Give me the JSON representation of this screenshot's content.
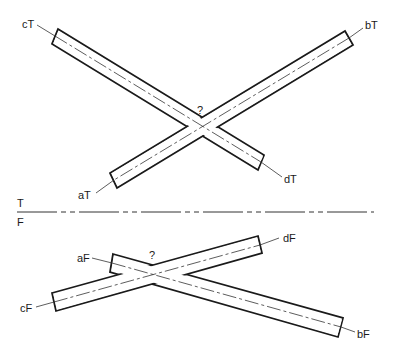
{
  "fold_line": {
    "top_label": "T",
    "bottom_label": "F"
  },
  "top_view": {
    "rod_ab": {
      "end_a_label": "aT",
      "end_b_label": "bT"
    },
    "rod_cd": {
      "end_c_label": "cT",
      "end_d_label": "dT"
    },
    "question_mark": "?"
  },
  "front_view": {
    "rod_ab": {
      "end_a_label": "aF",
      "end_b_label": "bF"
    },
    "rod_cd": {
      "end_c_label": "cF",
      "end_d_label": "dF"
    },
    "question_mark": "?"
  },
  "colors": {
    "line": "#1a1a1a",
    "background": "#ffffff"
  }
}
